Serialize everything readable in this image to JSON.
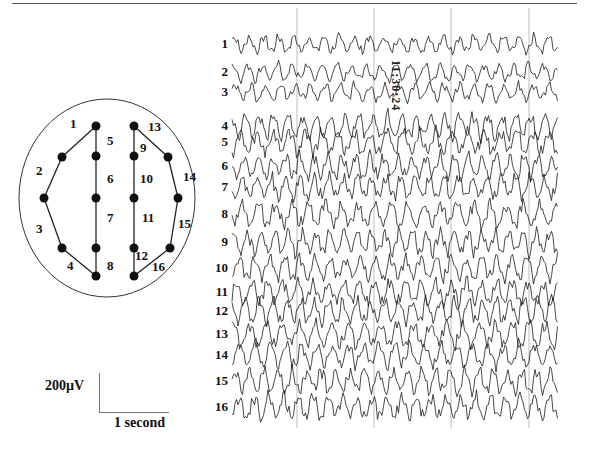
{
  "figure": {
    "type": "multichannel EEG recording with electrode montage diagram",
    "timestamp": "11:30:24",
    "scale_bar": {
      "amplitude_label": "200µV",
      "time_label": "1 second"
    },
    "channels": [
      "1",
      "2",
      "3",
      "4",
      "5",
      "6",
      "7",
      "8",
      "9",
      "10",
      "11",
      "12",
      "13",
      "14",
      "15",
      "16"
    ],
    "channel_label_y": [
      44,
      72,
      92,
      126,
      142,
      166,
      187,
      214,
      242,
      268,
      292,
      311,
      334,
      355,
      381,
      407
    ],
    "time_gridlines_x": [
      297,
      374,
      451,
      529
    ],
    "trace_x_range": [
      232,
      558
    ],
    "trace_color": "#1a1a1a",
    "gridline_color": "#bdbdbd"
  },
  "montage": {
    "head_outline": {
      "cx": 107,
      "cy": 198,
      "rx": 88,
      "ry": 99
    },
    "electrodes": {
      "L_Fp": [
        96,
        126
      ],
      "L_F": [
        62,
        157
      ],
      "L_T": [
        44,
        198
      ],
      "L_O": [
        62,
        248
      ],
      "L_bot": [
        96,
        276
      ],
      "LC_F": [
        96,
        156
      ],
      "LC_C": [
        96,
        198
      ],
      "LC_P": [
        96,
        248
      ],
      "R_Fp": [
        134,
        126
      ],
      "R_F": [
        168,
        157
      ],
      "R_T": [
        178,
        198
      ],
      "R_O": [
        170,
        248
      ],
      "R_bot": [
        134,
        276
      ],
      "RC_F": [
        134,
        156
      ],
      "RC_C": [
        134,
        198
      ],
      "RC_P": [
        134,
        248
      ]
    },
    "chain_links": [
      [
        "L_Fp",
        "L_F"
      ],
      [
        "L_F",
        "L_T"
      ],
      [
        "L_T",
        "L_O"
      ],
      [
        "L_O",
        "L_bot"
      ],
      [
        "L_Fp",
        "LC_F"
      ],
      [
        "LC_F",
        "LC_C"
      ],
      [
        "LC_C",
        "LC_P"
      ],
      [
        "LC_P",
        "L_bot"
      ],
      [
        "R_Fp",
        "RC_F"
      ],
      [
        "RC_F",
        "RC_C"
      ],
      [
        "RC_C",
        "RC_P"
      ],
      [
        "RC_P",
        "R_bot"
      ],
      [
        "R_Fp",
        "R_F"
      ],
      [
        "R_F",
        "R_T"
      ],
      [
        "R_T",
        "R_O"
      ],
      [
        "R_O",
        "R_bot"
      ]
    ],
    "channel_labels": [
      {
        "text": "1",
        "x": 70,
        "y": 128
      },
      {
        "text": "2",
        "x": 36,
        "y": 175
      },
      {
        "text": "3",
        "x": 36,
        "y": 233
      },
      {
        "text": "4",
        "x": 67,
        "y": 270
      },
      {
        "text": "5",
        "x": 107,
        "y": 145
      },
      {
        "text": "6",
        "x": 107,
        "y": 183
      },
      {
        "text": "7",
        "x": 107,
        "y": 222
      },
      {
        "text": "8",
        "x": 107,
        "y": 270
      },
      {
        "text": "9",
        "x": 140,
        "y": 152
      },
      {
        "text": "10",
        "x": 140,
        "y": 183
      },
      {
        "text": "11",
        "x": 142,
        "y": 222
      },
      {
        "text": "12",
        "x": 135,
        "y": 260
      },
      {
        "text": "13",
        "x": 148,
        "y": 131
      },
      {
        "text": "14",
        "x": 183,
        "y": 181
      },
      {
        "text": "15",
        "x": 178,
        "y": 228
      },
      {
        "text": "16",
        "x": 152,
        "y": 271
      }
    ]
  }
}
